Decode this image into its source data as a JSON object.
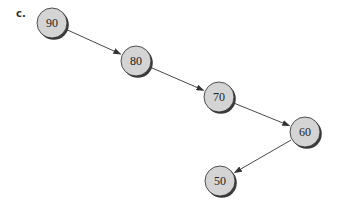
{
  "diagram": {
    "label": "c.",
    "type": "linked tree (degenerate binary search tree)",
    "colors": {
      "node_fill": "#d4d4d4",
      "node_stroke": "#2a2a2a",
      "node_shadow": "#3a3a3a",
      "edge": "#333333"
    },
    "nodes": [
      {
        "id": "n90",
        "value": "90",
        "cx": 52,
        "cy": 23
      },
      {
        "id": "n80",
        "value": "80",
        "cx": 136,
        "cy": 61
      },
      {
        "id": "n70",
        "value": "70",
        "cx": 219,
        "cy": 97
      },
      {
        "id": "n60",
        "value": "60",
        "cx": 305,
        "cy": 132
      },
      {
        "id": "n50",
        "value": "50",
        "cx": 220,
        "cy": 181
      }
    ],
    "edges": [
      {
        "from": "90",
        "to": "80"
      },
      {
        "from": "80",
        "to": "70"
      },
      {
        "from": "70",
        "to": "60"
      },
      {
        "from": "60",
        "to": "50"
      }
    ]
  }
}
